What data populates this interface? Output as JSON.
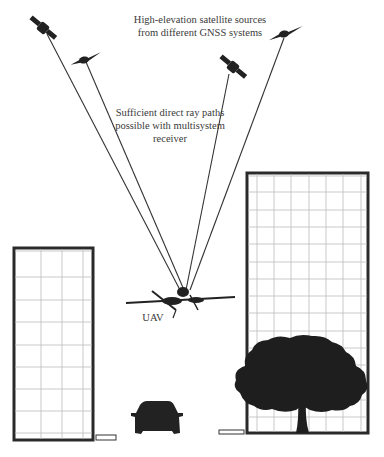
{
  "diagram": {
    "title_lines": [
      "High-elevation satellite sources",
      "from different GNSS systems"
    ],
    "ray_label_lines": [
      "Sufficient direct ray paths",
      "possible with multisystem",
      "receiver"
    ],
    "uav_label": "UAV",
    "receiver_point": {
      "x": 183,
      "y": 290
    },
    "satellites": [
      {
        "id": "sat-1",
        "x": 43,
        "y": 28,
        "orientation": "diagonal"
      },
      {
        "id": "sat-2",
        "x": 84,
        "y": 60,
        "orientation": "horizontal"
      },
      {
        "id": "sat-3",
        "x": 233,
        "y": 67,
        "orientation": "diagonal"
      },
      {
        "id": "sat-4",
        "x": 284,
        "y": 34,
        "orientation": "horizontal"
      }
    ],
    "obstacles": [
      {
        "id": "left-building",
        "type": "building",
        "x": 14,
        "y": 248,
        "w": 79,
        "h": 192,
        "cols": 4,
        "rows": 9
      },
      {
        "id": "right-building",
        "type": "building",
        "x": 247,
        "y": 173,
        "w": 121,
        "h": 260,
        "cols": 7,
        "rows": 14
      },
      {
        "id": "car",
        "type": "car",
        "x": 130,
        "y": 402,
        "w": 53,
        "h": 32
      },
      {
        "id": "tree",
        "type": "tree",
        "x": 232,
        "y": 337,
        "w": 136,
        "h": 96
      }
    ],
    "colors": {
      "ink": "#222222",
      "grid": "#bbbbbb",
      "background": "#ffffff"
    }
  }
}
